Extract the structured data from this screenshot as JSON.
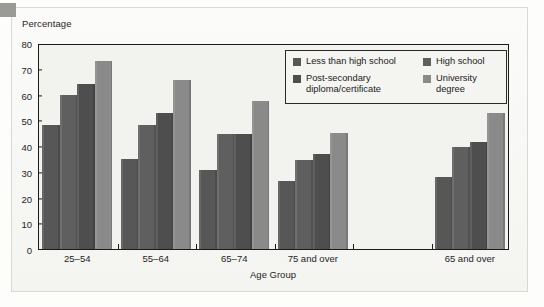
{
  "figure": {
    "y_axis_title": "Percentage",
    "x_axis_title": "Age Group"
  },
  "legend": {
    "entries": [
      {
        "label": "Less than high school",
        "color": "#575757",
        "column": "left"
      },
      {
        "label": "Post-secondary\ndiploma/certificate",
        "color": "#4e4e4e",
        "column": "left"
      },
      {
        "label": "High school",
        "color": "#5f5f5f",
        "column": "right"
      },
      {
        "label": "University degree",
        "color": "#8a8a8a",
        "column": "right"
      }
    ]
  },
  "chart_data": {
    "type": "bar",
    "title": "",
    "xlabel": "Age Group",
    "ylabel": "Percentage",
    "ylim": [
      0,
      80
    ],
    "yticks": [
      0,
      10,
      20,
      30,
      40,
      50,
      60,
      70,
      80
    ],
    "grid": false,
    "legend_position": "top-right",
    "categories": [
      "25–54",
      "55–64",
      "65–74",
      "75 and over",
      "",
      "65 and over"
    ],
    "series": [
      {
        "name": "Less than high school",
        "color": "#575757",
        "values": [
          48,
          35,
          30.5,
          26.5,
          null,
          28
        ]
      },
      {
        "name": "High school",
        "color": "#5f5f5f",
        "values": [
          60,
          48,
          44.5,
          34.5,
          null,
          39.5
        ]
      },
      {
        "name": "Post-secondary diploma/certificate",
        "color": "#4e4e4e",
        "values": [
          64,
          53,
          44.5,
          37,
          null,
          41.5
        ]
      },
      {
        "name": "University degree",
        "color": "#8a8a8a",
        "values": [
          73,
          65.5,
          57.5,
          45,
          null,
          53
        ]
      }
    ]
  }
}
